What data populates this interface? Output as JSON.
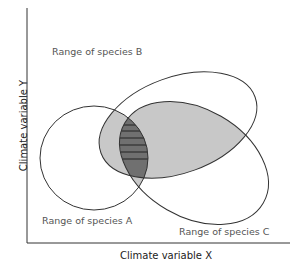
{
  "diagram": {
    "type": "venn-climate-niche",
    "axes": {
      "x_label": "Climate variable X",
      "y_label": "Climate variable Y"
    },
    "sets": [
      {
        "id": "A",
        "label": "Range of species A"
      },
      {
        "id": "B",
        "label": "Range of species B"
      },
      {
        "id": "C",
        "label": "Range of species C"
      }
    ],
    "regions": {
      "pairwise_overlap_fill": "#c8c8c8",
      "triple_overlap_fill": "#707070",
      "triple_overlap_hatch": "horizontal lines"
    },
    "colors": {
      "outline": "#333333",
      "axis": "#333333",
      "label": "#555555"
    }
  }
}
